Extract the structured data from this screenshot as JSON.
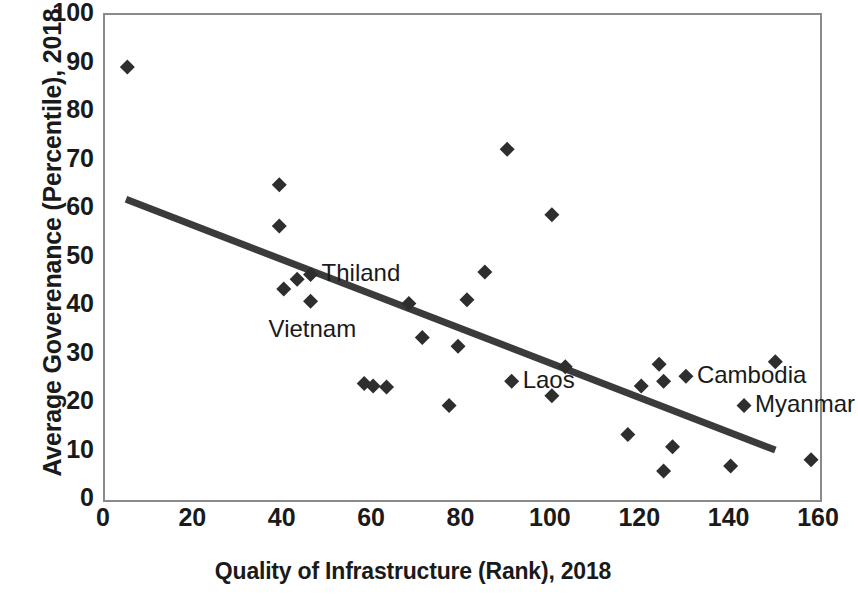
{
  "chart_data": {
    "type": "scatter",
    "title": "",
    "xlabel": "Quality of Infrastructure (Rank), 2018",
    "ylabel": "Average Goverenance (Percentile), 2018",
    "xlim": [
      0,
      160
    ],
    "ylim": [
      0,
      100
    ],
    "xticks": [
      0,
      20,
      40,
      60,
      80,
      100,
      120,
      140,
      160
    ],
    "yticks": [
      0,
      10,
      20,
      30,
      40,
      50,
      60,
      70,
      80,
      90,
      100
    ],
    "grid": false,
    "legend": false,
    "marker": "diamond",
    "marker_color": "#2e2e2e",
    "axis_color": "#8a8a8a",
    "series": [
      {
        "name": "Countries",
        "points": [
          {
            "x": 5,
            "y": 89.3
          },
          {
            "x": 39,
            "y": 65.0
          },
          {
            "x": 39,
            "y": 56.5
          },
          {
            "x": 40,
            "y": 43.5
          },
          {
            "x": 43,
            "y": 45.5
          },
          {
            "x": 46,
            "y": 46.5,
            "label": "Thiland",
            "label_pos": "right"
          },
          {
            "x": 46,
            "y": 41.0,
            "label": "Vietnam",
            "label_pos": "below-left"
          },
          {
            "x": 58,
            "y": 24.0
          },
          {
            "x": 60,
            "y": 23.5
          },
          {
            "x": 63,
            "y": 23.3
          },
          {
            "x": 68,
            "y": 40.5
          },
          {
            "x": 71,
            "y": 33.5
          },
          {
            "x": 77,
            "y": 19.5
          },
          {
            "x": 79,
            "y": 31.7
          },
          {
            "x": 81,
            "y": 41.3
          },
          {
            "x": 85,
            "y": 47.0
          },
          {
            "x": 90,
            "y": 72.3
          },
          {
            "x": 91,
            "y": 24.5,
            "label": "Laos",
            "label_pos": "right"
          },
          {
            "x": 100,
            "y": 58.8
          },
          {
            "x": 100,
            "y": 21.5
          },
          {
            "x": 103,
            "y": 27.5
          },
          {
            "x": 117,
            "y": 13.5
          },
          {
            "x": 120,
            "y": 23.5
          },
          {
            "x": 124,
            "y": 28.0
          },
          {
            "x": 125,
            "y": 24.5
          },
          {
            "x": 125,
            "y": 6.0
          },
          {
            "x": 127,
            "y": 11.0
          },
          {
            "x": 130,
            "y": 25.5,
            "label": "Cambodia",
            "label_pos": "right"
          },
          {
            "x": 140,
            "y": 7.0
          },
          {
            "x": 143,
            "y": 19.5,
            "label": "Myanmar",
            "label_pos": "right"
          },
          {
            "x": 150,
            "y": 28.5
          },
          {
            "x": 158,
            "y": 8.3
          }
        ]
      }
    ],
    "trendline": {
      "type": "linear",
      "x_start": 4.7,
      "y_start": 62.0,
      "x_end": 150.0,
      "y_end": 10.3,
      "color": "#3b3b3b",
      "width": 7
    }
  }
}
